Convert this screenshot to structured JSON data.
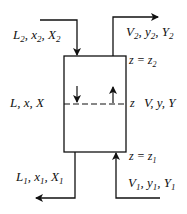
{
  "labels": {
    "top_left": {
      "main": "L",
      "sub": "2",
      "rest1": ", x",
      "sub2": "2",
      "rest2": ", X",
      "sub3": "2"
    },
    "top_right": {
      "main": "V",
      "sub": "2",
      "rest1": ", y",
      "sub2": "2",
      "rest2": ", Y",
      "sub3": "2"
    },
    "bottom_left": {
      "main": "L",
      "sub": "1",
      "rest1": ", x",
      "sub2": "1",
      "rest2": ", X",
      "sub3": "1"
    },
    "bottom_right": {
      "main": "V",
      "sub": "1",
      "rest1": ", y",
      "sub2": "1",
      "rest2": ", Y",
      "sub3": "1"
    },
    "middle_left": "L, x, X",
    "middle_right": "V, y, Y",
    "z_top": "z = z",
    "z_top_sub": "2",
    "z_mid": "z",
    "z_bottom": "z = z",
    "z_bottom_sub": "1"
  }
}
